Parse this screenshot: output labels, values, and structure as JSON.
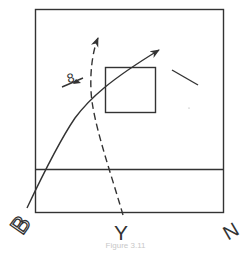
{
  "figure": {
    "caption": "Figure 3.11",
    "colors": {
      "stroke": "#333333",
      "background": "#ffffff",
      "caption": "#c8c8c8"
    },
    "labels": {
      "left_corner": "B",
      "bottom_center": "Y",
      "right_corner": "N",
      "symbol": "8"
    },
    "elements": [
      {
        "name": "outer-frame",
        "type": "rectangle"
      },
      {
        "name": "horizontal-divider",
        "type": "line"
      },
      {
        "name": "inner-square",
        "type": "rectangle"
      },
      {
        "name": "solid-curve-arrow",
        "type": "curved-arrow",
        "style": "solid"
      },
      {
        "name": "dashed-curve-arrow",
        "type": "curved-arrow",
        "style": "dashed"
      },
      {
        "name": "short-arrow-with-symbol",
        "type": "arrow"
      },
      {
        "name": "diagonal-segment",
        "type": "line"
      }
    ]
  }
}
